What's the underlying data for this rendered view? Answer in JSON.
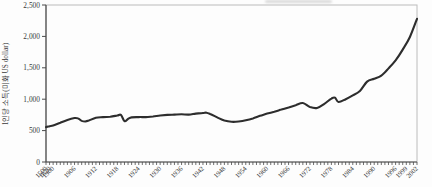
{
  "chart": {
    "colors": {
      "line": "#2d2d2d",
      "axis": "#4a4a4a",
      "frame": "#bcbcbc",
      "text": "#3a3a3a"
    }
  },
  "chart_data": {
    "type": "line",
    "title": "",
    "xlabel": "",
    "ylabel": "1인당 소득(미화 US dollar)",
    "ylim": [
      0,
      2500
    ],
    "grid": false,
    "legend": null,
    "y_ticks": [
      "0",
      "500",
      "1,000",
      "1,500",
      "2,000",
      "2,500"
    ],
    "y_tick_values": [
      0,
      500,
      1000,
      1500,
      2000,
      2500
    ],
    "x_categories": {
      "special": [
        1500,
        1820
      ],
      "year_start": 1900,
      "year_end": 2002
    },
    "x_labels": [
      "1500",
      "1820",
      "1900",
      "1906",
      "1912",
      "1918",
      "1924",
      "1930",
      "1936",
      "1942",
      "1948",
      "1954",
      "1960",
      "1966",
      "1972",
      "1978",
      "1984",
      "1990",
      "1996",
      "1999",
      "2002"
    ],
    "series": [
      {
        "name": "1인당 소득",
        "points": [
          [
            1500,
            555
          ],
          [
            1820,
            570
          ],
          [
            1900,
            580
          ],
          [
            1902,
            625
          ],
          [
            1904,
            670
          ],
          [
            1906,
            700
          ],
          [
            1907,
            695
          ],
          [
            1908,
            655
          ],
          [
            1909,
            645
          ],
          [
            1910,
            660
          ],
          [
            1912,
            705
          ],
          [
            1914,
            715
          ],
          [
            1916,
            720
          ],
          [
            1918,
            740
          ],
          [
            1919,
            750
          ],
          [
            1920,
            650
          ],
          [
            1921,
            685
          ],
          [
            1922,
            710
          ],
          [
            1924,
            715
          ],
          [
            1926,
            715
          ],
          [
            1928,
            725
          ],
          [
            1930,
            740
          ],
          [
            1932,
            750
          ],
          [
            1934,
            755
          ],
          [
            1936,
            760
          ],
          [
            1938,
            755
          ],
          [
            1940,
            770
          ],
          [
            1942,
            780
          ],
          [
            1943,
            785
          ],
          [
            1944,
            765
          ],
          [
            1946,
            710
          ],
          [
            1948,
            660
          ],
          [
            1950,
            640
          ],
          [
            1952,
            645
          ],
          [
            1954,
            665
          ],
          [
            1956,
            695
          ],
          [
            1958,
            735
          ],
          [
            1960,
            770
          ],
          [
            1962,
            800
          ],
          [
            1964,
            835
          ],
          [
            1966,
            870
          ],
          [
            1968,
            905
          ],
          [
            1970,
            940
          ],
          [
            1972,
            875
          ],
          [
            1974,
            860
          ],
          [
            1976,
            925
          ],
          [
            1978,
            1010
          ],
          [
            1979,
            1025
          ],
          [
            1980,
            955
          ],
          [
            1982,
            1000
          ],
          [
            1984,
            1060
          ],
          [
            1986,
            1130
          ],
          [
            1988,
            1280
          ],
          [
            1990,
            1325
          ],
          [
            1992,
            1375
          ],
          [
            1994,
            1490
          ],
          [
            1996,
            1620
          ],
          [
            1998,
            1790
          ],
          [
            2000,
            1990
          ],
          [
            2002,
            2280
          ]
        ]
      }
    ]
  }
}
